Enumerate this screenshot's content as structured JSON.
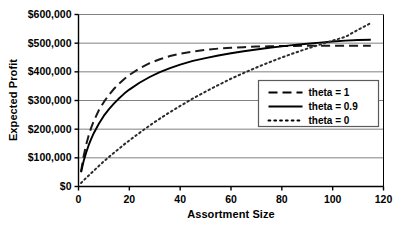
{
  "chart_data": {
    "type": "line",
    "title": "",
    "xlabel": "Assortment Size",
    "ylabel": "Expected Profit",
    "xlim": [
      0,
      120
    ],
    "ylim": [
      0,
      600000
    ],
    "xticks": [
      0,
      20,
      40,
      60,
      80,
      100,
      120
    ],
    "yticks": [
      0,
      100000,
      200000,
      300000,
      400000,
      500000,
      600000
    ],
    "xtick_labels": [
      "0",
      "20",
      "40",
      "60",
      "80",
      "100",
      "120"
    ],
    "ytick_labels": [
      "$0",
      "$100,000",
      "$200,000",
      "$300,000",
      "$400,000",
      "$500,000",
      "$600,000"
    ],
    "grid": "horizontal",
    "legend_position": "center-right",
    "series": [
      {
        "name": "theta = 1",
        "style": "dashed",
        "color": "#1a1a1a",
        "x": [
          1,
          2,
          3,
          4,
          5,
          6,
          8,
          10,
          12,
          14,
          16,
          18,
          20,
          24,
          28,
          32,
          36,
          40,
          45,
          50,
          55,
          60,
          65,
          70,
          75,
          80,
          85,
          90,
          95,
          100,
          105,
          110,
          115
        ],
        "y": [
          52000,
          105000,
          145000,
          178000,
          205000,
          228000,
          266000,
          295000,
          320000,
          341000,
          359000,
          375000,
          389000,
          412000,
          430000,
          444000,
          455000,
          463000,
          471000,
          477000,
          481000,
          484000,
          486000,
          488000,
          489000,
          490000,
          490500,
          491000,
          491000,
          491000,
          491000,
          491000,
          491000
        ]
      },
      {
        "name": "theta = 0.9",
        "style": "solid",
        "color": "#000000",
        "x": [
          1,
          2,
          3,
          4,
          5,
          6,
          8,
          10,
          12,
          14,
          16,
          18,
          20,
          24,
          28,
          32,
          36,
          40,
          45,
          50,
          55,
          60,
          65,
          70,
          75,
          80,
          85,
          90,
          95,
          100,
          105,
          110,
          115
        ],
        "y": [
          50000,
          88000,
          118000,
          144000,
          166000,
          186000,
          219000,
          247000,
          270000,
          290000,
          308000,
          324000,
          338000,
          362000,
          382000,
          399000,
          413000,
          425000,
          438000,
          448000,
          457000,
          465000,
          472000,
          478000,
          484000,
          489000,
          494000,
          498000,
          502000,
          506000,
          509000,
          511000,
          512000
        ]
      },
      {
        "name": "theta = 0",
        "style": "dotted",
        "color": "#2b2b2b",
        "x": [
          1,
          3,
          6,
          10,
          14,
          18,
          22,
          26,
          30,
          35,
          40,
          45,
          50,
          55,
          60,
          65,
          70,
          75,
          80,
          85,
          90,
          95,
          100,
          105,
          110,
          115
        ],
        "y": [
          12000,
          30000,
          55000,
          88000,
          118000,
          147000,
          174000,
          200000,
          225000,
          254000,
          281000,
          307000,
          331000,
          354000,
          376000,
          396000,
          415000,
          433000,
          450000,
          466000,
          481000,
          495000,
          509000,
          522000,
          547000,
          570000
        ]
      }
    ]
  },
  "axes": {
    "y_title": "Expected Profit",
    "x_title": "Assortment Size"
  },
  "legend": {
    "items": [
      {
        "label": "theta = 1",
        "style": "dashed"
      },
      {
        "label": "theta = 0.9",
        "style": "solid"
      },
      {
        "label": "theta = 0",
        "style": "dotted"
      }
    ]
  },
  "colors": {
    "background": "#ffffff",
    "axis": "#000000",
    "grid": "#808080",
    "text": "#000000"
  }
}
